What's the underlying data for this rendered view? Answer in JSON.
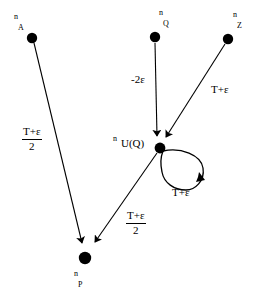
{
  "diagram": {
    "type": "directed-graph",
    "width": 265,
    "height": 299,
    "background_color": "#ffffff",
    "stroke_color": "#000000",
    "nodes": [
      {
        "id": "nA",
        "label_sup": "n",
        "label_sub": "A",
        "x": 32,
        "y": 38,
        "r": 5
      },
      {
        "id": "nQ",
        "label_sup": "n",
        "label_sub": "Q",
        "x": 155,
        "y": 37,
        "r": 5
      },
      {
        "id": "nZ",
        "label_sup": "n",
        "label_sub": "Z",
        "x": 228,
        "y": 39,
        "r": 5
      },
      {
        "id": "nUQ",
        "label_sup": "n",
        "label_main": "U(Q)",
        "x": 160,
        "y": 148,
        "r": 5
      },
      {
        "id": "nP",
        "label_sup": "n",
        "label_sub": "P",
        "x": 85,
        "y": 258,
        "r": 6
      }
    ],
    "edges": [
      {
        "id": "e1",
        "from": "nA",
        "to": "nP",
        "label_type": "fraction",
        "numerator": "T+ε",
        "denominator": "2"
      },
      {
        "id": "e2",
        "from": "nQ",
        "to": "nUQ",
        "label_type": "plain",
        "label": "-2ε"
      },
      {
        "id": "e3",
        "from": "nZ",
        "to": "nUQ",
        "label_type": "plain",
        "label": "T+ε"
      },
      {
        "id": "e4",
        "from": "nUQ",
        "to": "nP",
        "label_type": "fraction",
        "numerator": "T+ε",
        "denominator": "2"
      },
      {
        "id": "e5",
        "from": "nUQ",
        "to": "nUQ",
        "label_type": "plain",
        "label": "T+ε",
        "self_loop": true
      }
    ]
  },
  "labels": {
    "node_a_sup": "n",
    "node_a_sub": "A",
    "node_q_sup": "n",
    "node_q_sub": "Q",
    "node_z_sup": "n",
    "node_z_sub": "Z",
    "node_uq_sup": "n",
    "node_uq_main": "U(Q)",
    "node_p_sup": "n",
    "node_p_sub": "P",
    "edge_a_p_num": "T+ε",
    "edge_a_p_den": "2",
    "edge_q_uq": "-2ε",
    "edge_z_uq": "T+ε",
    "edge_uq_p_num": "T+ε",
    "edge_uq_p_den": "2",
    "edge_self_loop": "T+ε"
  }
}
